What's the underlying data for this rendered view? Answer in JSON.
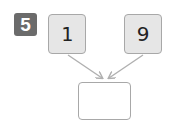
{
  "problem": {
    "number": "5",
    "operands": [
      {
        "value": "1",
        "position": "left"
      },
      {
        "value": "9",
        "position": "right"
      }
    ],
    "answer": ""
  },
  "colors": {
    "badge_bg": "#6b6b6b",
    "badge_text": "#ffffff",
    "box_fill": "#e6e6e6",
    "box_border": "#a8a8a8",
    "arrow": "#b0b0b0"
  },
  "icons": {
    "arrows": [
      "arrow-down-right-icon",
      "arrow-down-left-icon"
    ]
  }
}
